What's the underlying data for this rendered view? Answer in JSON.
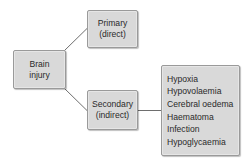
{
  "diagram": {
    "type": "tree",
    "root": {
      "label_lines": [
        "Brain",
        "injury"
      ]
    },
    "branches": [
      {
        "id": "primary",
        "label_lines": [
          "Primary",
          "(direct)"
        ]
      },
      {
        "id": "secondary",
        "label_lines": [
          "Secondary",
          "(indirect)"
        ],
        "causes": [
          "Hypoxia",
          "Hypovolaemia",
          "Cerebral oedema",
          "Haematoma",
          "Infection",
          "Hypoglycaemia"
        ]
      }
    ],
    "colors": {
      "box_fill": "#d9d9d9",
      "box_border": "#9a9a9a",
      "connector": "#6e6e6e",
      "text": "#2a2a2a"
    }
  }
}
